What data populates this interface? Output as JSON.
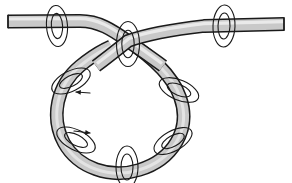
{
  "figure": {
    "title": "Looped tube with crossing and twist markers",
    "width": 292,
    "height": 183,
    "background_color": "#ffffff"
  },
  "style": {
    "tube_fill": "#c9c9c9",
    "tube_highlight": "#eaeaea",
    "tube_shadow": "#a8a8a8",
    "tube_outline": "#1a1a1a",
    "tube_outline_width": 1.6,
    "tube_width": 11,
    "marker_stroke": "#1a1a1a",
    "marker_stroke_width": 1.1,
    "marker_fill": "none",
    "arrow_color": "#1a1a1a"
  },
  "geometry": {
    "loop_center_x": 128,
    "loop_center_y": 113,
    "loop_radius": 59,
    "crossing_x": 128,
    "crossing_y": 41,
    "left_end_x": 8,
    "left_end_y": 24,
    "right_end_x": 284,
    "right_end_y": 25
  },
  "strands": [
    {
      "name": "left-tail-strand",
      "label": "left tail passing under at crossing",
      "path": "M 8 21.5 L 82 21 C 100 21 112 30 128 41 C 150 56 170 74 178 96 C 190 128 172 158 140 169 C 112 178 80 168 66 143 C 52 118 58 86 80 67 C 98 52 112 44 128 41 C 150 37 176 31 200 27 L 284 24"
    }
  ],
  "markers": [
    {
      "name": "twist-marker-left-tail",
      "cx": 57,
      "cy": 26,
      "rx": 6.5,
      "ry": 13.5,
      "rotation": -4,
      "rings": 2,
      "arrow": false
    },
    {
      "name": "twist-marker-crossing",
      "cx": 128,
      "cy": 44,
      "rx": 7.0,
      "ry": 15.0,
      "rotation": 0,
      "rings": 2,
      "arrow": false
    },
    {
      "name": "twist-marker-right-tail",
      "cx": 224,
      "cy": 26,
      "rx": 7.0,
      "ry": 14.0,
      "rotation": 2,
      "rings": 2,
      "arrow": false
    },
    {
      "name": "twist-marker-upper-left",
      "cx": 71,
      "cy": 80,
      "rx": 14.0,
      "ry": 6.5,
      "rotation": -26,
      "rings": 2,
      "arrow": true,
      "arrow_x": 79,
      "arrow_y": 92,
      "arrow_dir": "left"
    },
    {
      "name": "twist-marker-upper-right",
      "cx": 178,
      "cy": 90,
      "rx": 14.0,
      "ry": 6.5,
      "rotation": 22,
      "rings": 2,
      "arrow": false
    },
    {
      "name": "twist-marker-lower-left",
      "cx": 76,
      "cy": 139,
      "rx": 14.0,
      "ry": 7.0,
      "rotation": 26,
      "rings": 2,
      "arrow": true,
      "arrow_x": 86,
      "arrow_y": 134,
      "arrow_dir": "right"
    },
    {
      "name": "twist-marker-lower-right",
      "cx": 172,
      "cy": 140,
      "rx": 14.0,
      "ry": 7.0,
      "rotation": -28,
      "rings": 2,
      "arrow": false
    },
    {
      "name": "twist-marker-bottom",
      "cx": 127,
      "cy": 166,
      "rx": 7.0,
      "ry": 14.0,
      "rotation": 0,
      "rings": 2,
      "arrow": false
    }
  ]
}
